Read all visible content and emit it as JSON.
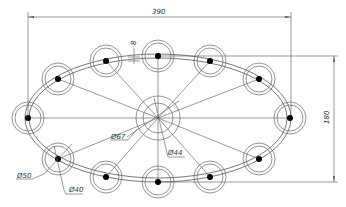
{
  "drawing": {
    "title": "Elliptical chandelier frame",
    "colors": {
      "line": "#555555",
      "dot": "#000000",
      "background": "#ffffff"
    },
    "dimensions": {
      "overall_width": "390",
      "overall_height": "180",
      "tube_thickness": "8",
      "hub_outer_diameter": "Ø67",
      "hub_inner_diameter": "Ø44",
      "cup_outer_diameter": "Ø50",
      "cup_inner_diameter": "Ø40"
    },
    "geometry": {
      "center": [
        158,
        118
      ],
      "ellipse_rx": 131,
      "ellipse_ry": 62,
      "hub_radii": [
        22,
        15
      ],
      "cup_radii": [
        16,
        13
      ],
      "cup_count": 12,
      "cups": [
        [
          28,
          118
        ],
        [
          58,
          79
        ],
        [
          106,
          61
        ],
        [
          158,
          56
        ],
        [
          210,
          61
        ],
        [
          259,
          79
        ],
        [
          290,
          118
        ],
        [
          259,
          159
        ],
        [
          210,
          177
        ],
        [
          158,
          182
        ],
        [
          106,
          177
        ],
        [
          58,
          159
        ]
      ]
    }
  }
}
